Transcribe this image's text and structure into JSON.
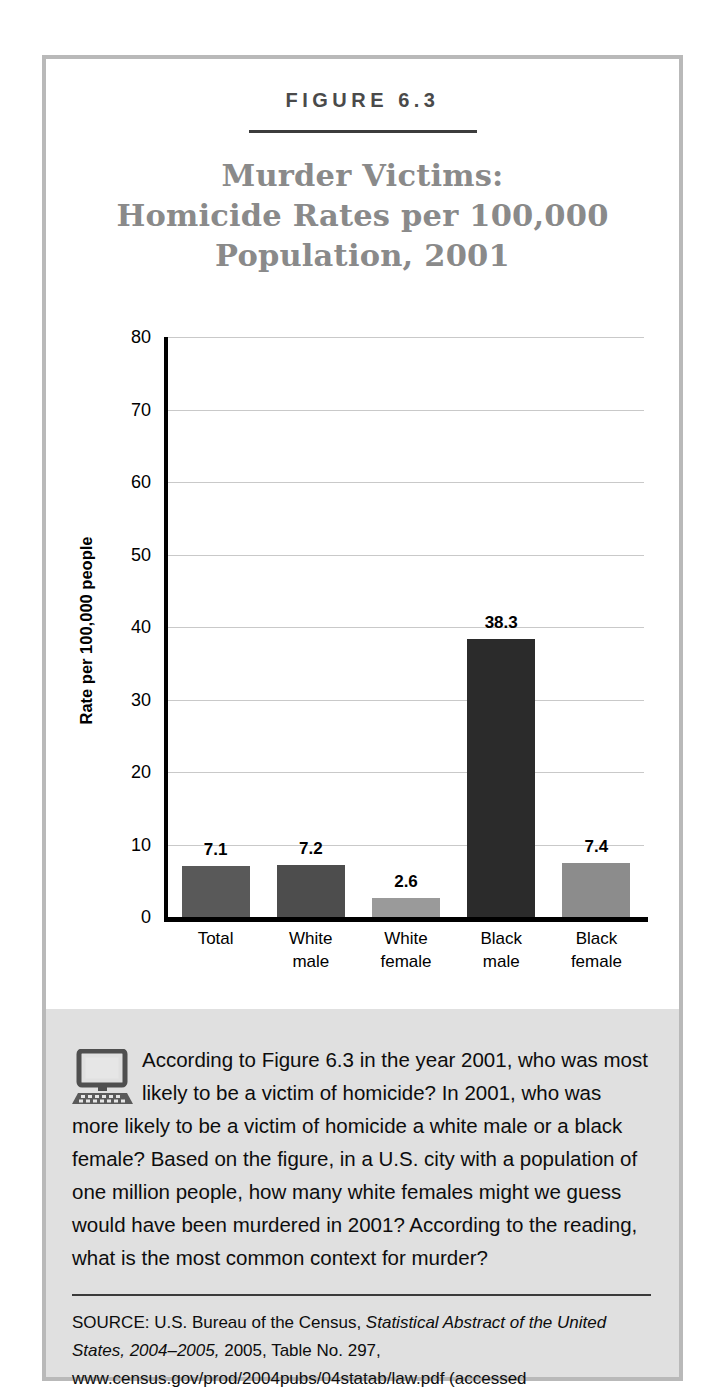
{
  "figure": {
    "label": "FIGURE 6.3",
    "title_lines": [
      "Murder Victims:",
      "Homicide Rates per 100,000",
      "Population, 2001"
    ]
  },
  "chart_data": {
    "type": "bar",
    "title": "Murder Victims: Homicide Rates per 100,000 Population, 2001",
    "xlabel": "",
    "ylabel": "Rate per 100,000 people",
    "ylim": [
      0,
      80
    ],
    "yticks": [
      0,
      10,
      20,
      30,
      40,
      50,
      60,
      70,
      80
    ],
    "grid": true,
    "legend": "none",
    "categories": [
      "Total",
      "White male",
      "White female",
      "Black male",
      "Black female"
    ],
    "category_lines": [
      [
        "Total",
        ""
      ],
      [
        "White",
        "male"
      ],
      [
        "White",
        "female"
      ],
      [
        "Black",
        "male"
      ],
      [
        "Black",
        "female"
      ]
    ],
    "values": [
      7.1,
      7.2,
      2.6,
      38.3,
      7.4
    ],
    "value_labels": [
      "7.1",
      "7.2",
      "2.6",
      "38.3",
      "7.4"
    ],
    "bar_colors": [
      "#595959",
      "#4d4d4d",
      "#9a9a9a",
      "#2b2b2b",
      "#8c8c8c"
    ]
  },
  "question": {
    "icon": "computer-icon",
    "text": "According to Figure 6.3 in the year 2001, who was most likely to be a victim of homicide? In 2001, who was more likely to be a victim of homicide a white male or a black female? Based on the figure, in a U.S. city with a population of one million people, how many white females might we guess would have been murdered in 2001? According to the reading, what is the most common context for murder?"
  },
  "source": {
    "prefix": "SOURCE:  U.S. Bureau of the Census, ",
    "italic1": "Statistical Abstract of the United States, 2004–2005,",
    "rest": " 2005, Table No. 297, www.census.gov/prod/2004pubs/04statab/law.pdf (accessed"
  },
  "colors": {
    "frame": "#b9b9b9",
    "title": "#8a8a8a",
    "panel_bg": "#e0e0e0",
    "axis": "#000000",
    "gridline": "#c9c9c9"
  }
}
